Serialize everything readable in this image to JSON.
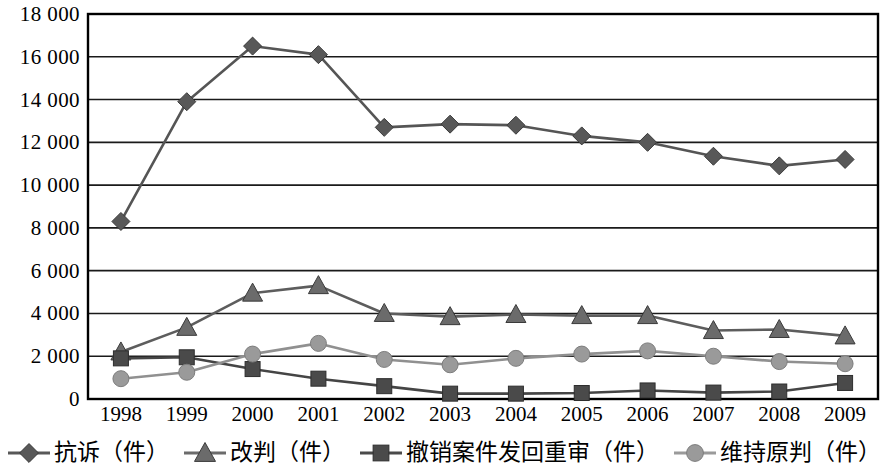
{
  "chart_data": {
    "type": "line",
    "title": "",
    "subtitle": "",
    "xlabel": "",
    "ylabel": "",
    "categories": [
      "1998",
      "1999",
      "2000",
      "2001",
      "2002",
      "2003",
      "2004",
      "2005",
      "2006",
      "2007",
      "2008",
      "2009"
    ],
    "x": [
      1998,
      1999,
      2000,
      2001,
      2002,
      2003,
      2004,
      2005,
      2006,
      2007,
      2008,
      2009
    ],
    "ylim": [
      0,
      18000
    ],
    "ytick_values": [
      0,
      2000,
      4000,
      6000,
      8000,
      10000,
      12000,
      14000,
      16000,
      18000
    ],
    "ytick_labels": [
      "0",
      "2 000",
      "4 000",
      "6 000",
      "8 000",
      "10 000",
      "12 000",
      "14 000",
      "16 000",
      "18 000"
    ],
    "grid": true,
    "grid_axis": "y",
    "legend_position": "bottom",
    "series": [
      {
        "name": "抗诉（件）",
        "marker": "diamond",
        "color": "#585858",
        "line_color": "#555555",
        "values": [
          8300,
          13900,
          16500,
          16100,
          12700,
          12850,
          12800,
          12300,
          12000,
          11350,
          10900,
          11200
        ]
      },
      {
        "name": "改判（件）",
        "marker": "triangle",
        "color": "#6b6b6b",
        "line_color": "#5d5d5d",
        "values": [
          2200,
          3350,
          4950,
          5300,
          4000,
          3850,
          3950,
          3900,
          3900,
          3200,
          3250,
          2950
        ]
      },
      {
        "name": "撤销案件发回重审（件）",
        "marker": "square",
        "color": "#4a4a4a",
        "line_color": "#454545",
        "values": [
          1900,
          1950,
          1400,
          950,
          600,
          250,
          250,
          280,
          400,
          300,
          350,
          750
        ]
      },
      {
        "name": "维持原判（件）",
        "marker": "circle",
        "color": "#9a9a9a",
        "line_color": "#909090",
        "values": [
          950,
          1250,
          2100,
          2600,
          1850,
          1600,
          1900,
          2100,
          2250,
          2000,
          1750,
          1650
        ]
      }
    ]
  },
  "legend": {
    "items": [
      {
        "label": "抗诉（件）",
        "marker": "diamond-marker-icon",
        "color": "#585858"
      },
      {
        "label": "改判（件）",
        "marker": "triangle-marker-icon",
        "color": "#6b6b6b"
      },
      {
        "label": "撤销案件发回重审（件）",
        "marker": "square-marker-icon",
        "color": "#4a4a4a"
      },
      {
        "label": "维持原判（件）",
        "marker": "circle-marker-icon",
        "color": "#9a9a9a"
      }
    ]
  },
  "axes": {
    "plot_border_color": "#000000",
    "gridline_color": "#1a1a1a"
  }
}
